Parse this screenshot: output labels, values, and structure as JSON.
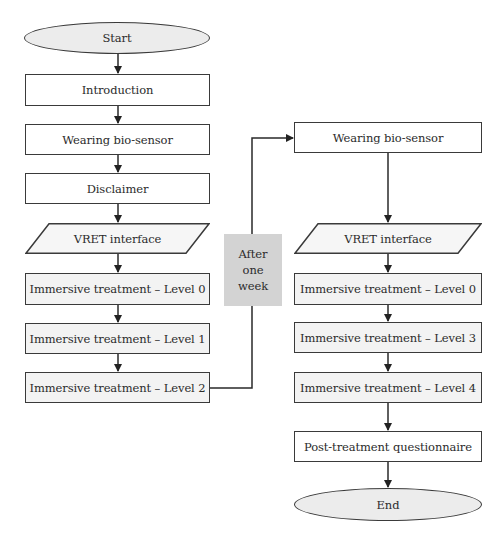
{
  "diagram": {
    "type": "flowchart",
    "left_column": {
      "start": "Start",
      "steps": [
        "Introduction",
        "Wearing bio-sensor",
        "Disclaimer",
        "VRET interface",
        "Immersive treatment – Level 0",
        "Immersive treatment – Level 1",
        "Immersive treatment – Level 2"
      ]
    },
    "transition_note": {
      "line1": "After",
      "line2": "one",
      "line3": "week"
    },
    "right_column": {
      "steps": [
        "Wearing bio-sensor",
        "VRET interface",
        "Immersive treatment – Level 0",
        "Immersive treatment – Level 3",
        "Immersive treatment – Level 4",
        "Post-treatment questionnaire"
      ],
      "end": "End"
    },
    "colors": {
      "stroke": "#3a3a3a",
      "terminal_fill": "#ececec",
      "treatment_fill": "#f3f3f3",
      "note_fill": "#d3d3d3",
      "process_fill": "#ffffff"
    }
  }
}
